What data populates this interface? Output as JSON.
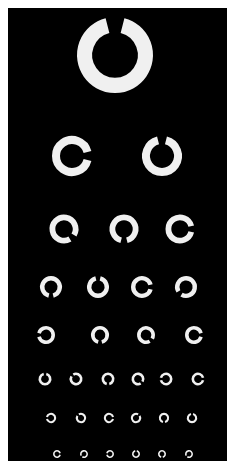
{
  "chart": {
    "background": "#000000",
    "ring_color": "#f0f0f0",
    "page_background": "#ffffff"
  },
  "rows": [
    {
      "y": 55,
      "outer": 38,
      "rings": [
        {
          "x": 115,
          "gap": "up"
        }
      ]
    },
    {
      "y": 156,
      "outer": 20,
      "rings": [
        {
          "x": 72,
          "gap": "right"
        },
        {
          "x": 162,
          "gap": "up"
        }
      ]
    },
    {
      "y": 229,
      "outer": 14.5,
      "rings": [
        {
          "x": 64,
          "gap": "down-right"
        },
        {
          "x": 124,
          "gap": "down"
        },
        {
          "x": 180,
          "gap": "right"
        }
      ]
    },
    {
      "y": 287,
      "outer": 11,
      "rings": [
        {
          "x": 51,
          "gap": "down"
        },
        {
          "x": 98,
          "gap": "up"
        },
        {
          "x": 142,
          "gap": "right"
        },
        {
          "x": 186,
          "gap": "down-left"
        }
      ]
    },
    {
      "y": 335,
      "outer": 9,
      "rings": [
        {
          "x": 46,
          "gap": "left"
        },
        {
          "x": 100,
          "gap": "down"
        },
        {
          "x": 146,
          "gap": "down-right"
        },
        {
          "x": 194,
          "gap": "right"
        }
      ]
    },
    {
      "y": 379,
      "outer": 6.5,
      "rings": [
        {
          "x": 45,
          "gap": "up"
        },
        {
          "x": 76,
          "gap": "up-left"
        },
        {
          "x": 108,
          "gap": "down"
        },
        {
          "x": 138,
          "gap": "down-right"
        },
        {
          "x": 166,
          "gap": "left"
        },
        {
          "x": 198,
          "gap": "right"
        }
      ]
    },
    {
      "y": 418,
      "outer": 5.2,
      "rings": [
        {
          "x": 51,
          "gap": "left"
        },
        {
          "x": 81,
          "gap": "up-left"
        },
        {
          "x": 109,
          "gap": "right"
        },
        {
          "x": 136,
          "gap": "up-right"
        },
        {
          "x": 164,
          "gap": "down"
        },
        {
          "x": 192,
          "gap": "up"
        }
      ]
    },
    {
      "y": 454,
      "outer": 4,
      "rings": [
        {
          "x": 57,
          "gap": "right"
        },
        {
          "x": 84,
          "gap": "down-left"
        },
        {
          "x": 110,
          "gap": "left"
        },
        {
          "x": 136,
          "gap": "up"
        },
        {
          "x": 162,
          "gap": "down"
        },
        {
          "x": 189,
          "gap": "down-left"
        }
      ]
    }
  ]
}
